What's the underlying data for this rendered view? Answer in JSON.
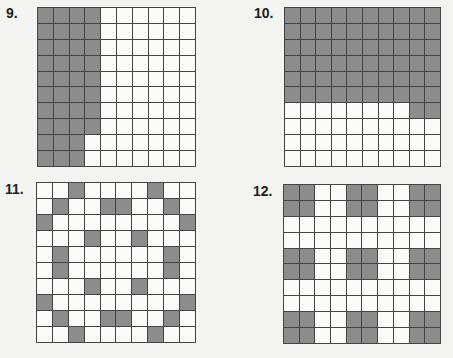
{
  "colors": {
    "shaded": "#8c8c8c",
    "unshaded": "#fafaf8",
    "grid_line": "#444444",
    "background": "#f3f3f1"
  },
  "problems": [
    {
      "number": "9.",
      "rows": 10,
      "cols": 10,
      "shaded_count": 38,
      "shaded": [
        [
          1,
          1,
          1,
          1,
          0,
          0,
          0,
          0,
          0,
          0
        ],
        [
          1,
          1,
          1,
          1,
          0,
          0,
          0,
          0,
          0,
          0
        ],
        [
          1,
          1,
          1,
          1,
          0,
          0,
          0,
          0,
          0,
          0
        ],
        [
          1,
          1,
          1,
          1,
          0,
          0,
          0,
          0,
          0,
          0
        ],
        [
          1,
          1,
          1,
          1,
          0,
          0,
          0,
          0,
          0,
          0
        ],
        [
          1,
          1,
          1,
          1,
          0,
          0,
          0,
          0,
          0,
          0
        ],
        [
          1,
          1,
          1,
          1,
          0,
          0,
          0,
          0,
          0,
          0
        ],
        [
          1,
          1,
          1,
          1,
          0,
          0,
          0,
          0,
          0,
          0
        ],
        [
          1,
          1,
          1,
          0,
          0,
          0,
          0,
          0,
          0,
          0
        ],
        [
          1,
          1,
          1,
          0,
          0,
          0,
          0,
          0,
          0,
          0
        ]
      ]
    },
    {
      "number": "10.",
      "rows": 10,
      "cols": 10,
      "shaded_count": 62,
      "shaded": [
        [
          1,
          1,
          1,
          1,
          1,
          1,
          1,
          1,
          1,
          1
        ],
        [
          1,
          1,
          1,
          1,
          1,
          1,
          1,
          1,
          1,
          1
        ],
        [
          1,
          1,
          1,
          1,
          1,
          1,
          1,
          1,
          1,
          1
        ],
        [
          1,
          1,
          1,
          1,
          1,
          1,
          1,
          1,
          1,
          1
        ],
        [
          1,
          1,
          1,
          1,
          1,
          1,
          1,
          1,
          1,
          1
        ],
        [
          1,
          1,
          1,
          1,
          1,
          1,
          1,
          1,
          1,
          1
        ],
        [
          0,
          0,
          0,
          0,
          0,
          0,
          0,
          0,
          1,
          1
        ],
        [
          0,
          0,
          0,
          0,
          0,
          0,
          0,
          0,
          0,
          0
        ],
        [
          0,
          0,
          0,
          0,
          0,
          0,
          0,
          0,
          0,
          0
        ],
        [
          0,
          0,
          0,
          0,
          0,
          0,
          0,
          0,
          0,
          0
        ]
      ]
    },
    {
      "number": "11.",
      "rows": 10,
      "cols": 10,
      "shaded_count": 24,
      "shaded": [
        [
          0,
          0,
          1,
          0,
          0,
          0,
          0,
          1,
          0,
          0
        ],
        [
          0,
          1,
          0,
          0,
          1,
          1,
          0,
          0,
          1,
          0
        ],
        [
          1,
          0,
          0,
          0,
          0,
          0,
          0,
          0,
          0,
          1
        ],
        [
          0,
          0,
          0,
          1,
          0,
          0,
          1,
          0,
          0,
          0
        ],
        [
          0,
          1,
          0,
          0,
          0,
          0,
          0,
          0,
          1,
          0
        ],
        [
          0,
          1,
          0,
          0,
          0,
          0,
          0,
          0,
          1,
          0
        ],
        [
          0,
          0,
          0,
          1,
          0,
          0,
          1,
          0,
          0,
          0
        ],
        [
          1,
          0,
          0,
          0,
          0,
          0,
          0,
          0,
          0,
          1
        ],
        [
          0,
          1,
          0,
          0,
          1,
          1,
          0,
          0,
          1,
          0
        ],
        [
          0,
          0,
          1,
          0,
          0,
          0,
          0,
          1,
          0,
          0
        ]
      ]
    },
    {
      "number": "12.",
      "rows": 10,
      "cols": 10,
      "shaded_count": 36,
      "shaded": [
        [
          1,
          1,
          0,
          0,
          1,
          1,
          0,
          0,
          1,
          1
        ],
        [
          1,
          1,
          0,
          0,
          1,
          1,
          0,
          0,
          1,
          1
        ],
        [
          0,
          0,
          0,
          0,
          0,
          0,
          0,
          0,
          0,
          0
        ],
        [
          0,
          0,
          0,
          0,
          0,
          0,
          0,
          0,
          0,
          0
        ],
        [
          1,
          1,
          0,
          0,
          1,
          1,
          0,
          0,
          1,
          1
        ],
        [
          1,
          1,
          0,
          0,
          1,
          1,
          0,
          0,
          1,
          1
        ],
        [
          0,
          0,
          0,
          0,
          0,
          0,
          0,
          0,
          0,
          0
        ],
        [
          0,
          0,
          0,
          0,
          0,
          0,
          0,
          0,
          0,
          0
        ],
        [
          1,
          1,
          0,
          0,
          1,
          1,
          0,
          0,
          1,
          1
        ],
        [
          1,
          1,
          0,
          0,
          1,
          1,
          0,
          0,
          1,
          1
        ]
      ]
    }
  ]
}
